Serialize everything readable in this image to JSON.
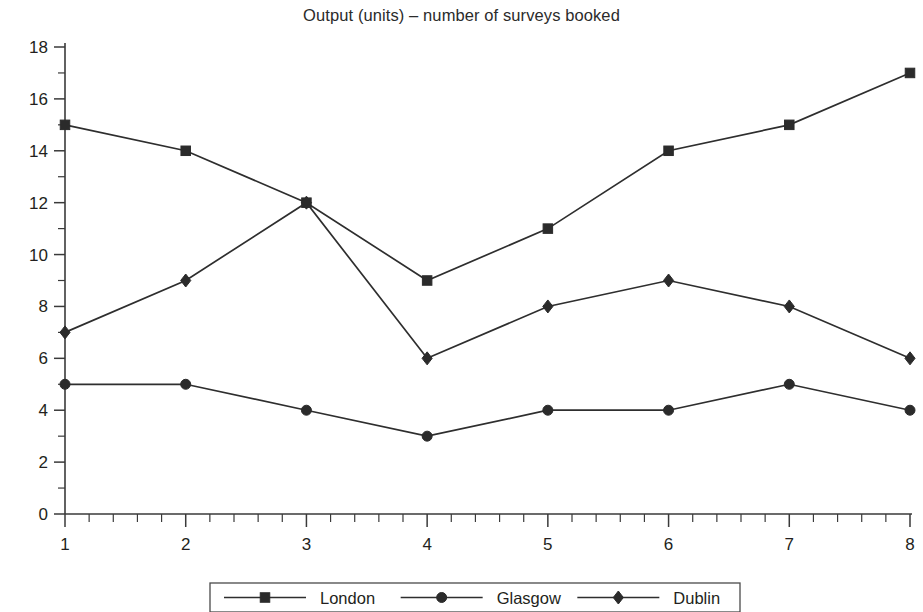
{
  "chart_data": {
    "type": "line",
    "title": "Output (units) – number of surveys booked",
    "xlabel": "",
    "ylabel": "",
    "x": [
      1,
      2,
      3,
      4,
      5,
      6,
      7,
      8
    ],
    "categories": [
      "1",
      "2",
      "3",
      "4",
      "5",
      "6",
      "7",
      "8"
    ],
    "xlim": [
      1,
      8
    ],
    "ylim": [
      0,
      18
    ],
    "y_tick_labels": [
      "0",
      "2",
      "4",
      "6",
      "8",
      "10",
      "12",
      "14",
      "16",
      "18"
    ],
    "y_ticks": [
      0,
      2,
      4,
      6,
      8,
      10,
      12,
      14,
      16,
      18
    ],
    "y_minor_step": 1,
    "x_tick_labels": [
      "1",
      "2",
      "3",
      "4",
      "5",
      "6",
      "7",
      "8"
    ],
    "x_minor_per_major": 5,
    "grid": false,
    "legend_position": "bottom",
    "line_color": "#2e2e2e",
    "series": [
      {
        "name": "London",
        "marker": "square",
        "values": [
          15,
          14,
          12,
          9,
          11,
          14,
          15,
          17
        ]
      },
      {
        "name": "Glasgow",
        "marker": "circle",
        "values": [
          5,
          5,
          4,
          3,
          4,
          4,
          5,
          4
        ]
      },
      {
        "name": "Dublin",
        "marker": "diamond",
        "values": [
          7,
          9,
          12,
          6,
          8,
          9,
          8,
          6
        ]
      }
    ]
  },
  "legend": {
    "items": [
      {
        "label": "London",
        "marker": "square-marker-icon"
      },
      {
        "label": "Glasgow",
        "marker": "circle-marker-icon"
      },
      {
        "label": "Dublin",
        "marker": "diamond-marker-icon"
      }
    ]
  }
}
